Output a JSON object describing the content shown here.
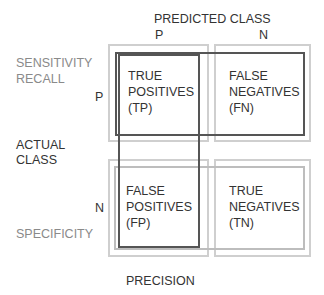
{
  "header": {
    "predicted_class": "PREDICTED CLASS",
    "predicted_p": "P",
    "predicted_n": "N"
  },
  "rows": {
    "actual_class_line1": "ACTUAL",
    "actual_class_line2": "CLASS",
    "actual_p": "P",
    "actual_n": "N"
  },
  "metrics": {
    "sensitivity": "SENSITIVITY",
    "recall": "RECALL",
    "specificity": "SPECIFICITY",
    "precision": "PRECISION"
  },
  "cells": {
    "tp": [
      "TRUE",
      "POSITIVES",
      "(TP)"
    ],
    "fn": [
      "FALSE",
      "NEGATIVES",
      "(FN)"
    ],
    "fp": [
      "FALSE",
      "POSITIVES",
      "(FP)"
    ],
    "tn": [
      "TRUE",
      "NEGATIVES",
      "(TN)"
    ]
  },
  "colors": {
    "cell_border": "#cfcfcf",
    "highlight_dark": "#555555",
    "highlight_light": "#bdbdbd",
    "label_gray": "#8a8a8a",
    "text": "#333333"
  }
}
